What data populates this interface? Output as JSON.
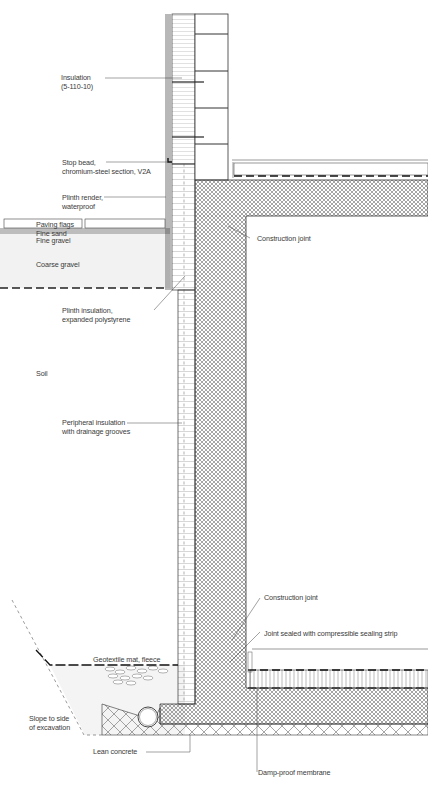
{
  "diagram": {
    "type": "construction-section-detail",
    "colors": {
      "line": "#2a2a2a",
      "hatch": "#6a6a6a",
      "gravel_fill": "#f2f2f2",
      "sand_fill": "#bdbdbd",
      "text": "#3a3a3a"
    },
    "labels": {
      "insulation": "Insulation\n(5-110-10)",
      "stop_bead": "Stop bead,\nchromium-steel section, V2A",
      "plinth_render": "Plinth render,\nwaterproof",
      "paving_flags": "Paving flags",
      "fine_sand": "Fine sand",
      "fine_gravel": "Fine gravel",
      "coarse_gravel": "Coarse gravel",
      "construction_joint_top": "Construction joint",
      "plinth_insulation": "Plinth insulation,\nexpanded polystyrene",
      "soil": "Soil",
      "peripheral_insulation": "Peripheral insulation\nwith drainage grooves",
      "construction_joint_bottom": "Construction joint",
      "joint_sealed": "Joint sealed with compressible sealing strip",
      "geotextile": "Geotextile mat, fleece",
      "slope": "Slope to side\nof excavation",
      "lean_concrete": "Lean concrete",
      "damp_proof": "Damp-proof membrane"
    }
  }
}
